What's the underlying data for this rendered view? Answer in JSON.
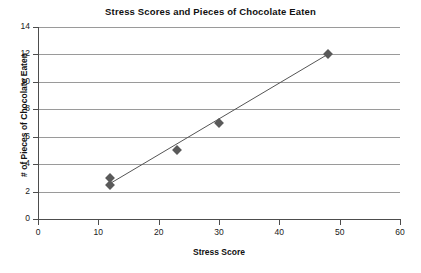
{
  "chart_data": {
    "type": "scatter",
    "title": "Stress Scores and Pieces of Chocolate Eaten",
    "xlabel": "Stress Score",
    "ylabel": "# of Pieces of Chocolate Eaten",
    "xlim": [
      0,
      60
    ],
    "ylim": [
      0,
      14
    ],
    "xticks": [
      0,
      10,
      20,
      30,
      40,
      50,
      60
    ],
    "yticks": [
      0,
      2,
      4,
      6,
      8,
      10,
      12,
      14
    ],
    "grid": "horizontal",
    "legend": "none",
    "marker": "diamond",
    "marker_color": "#5a5a5a",
    "trendline": {
      "visible": true,
      "color": "#555555",
      "x0": 12,
      "y0": 2.6,
      "x1": 48,
      "y1": 12.0
    },
    "points": [
      {
        "x": 12,
        "y": 3.0
      },
      {
        "x": 12,
        "y": 2.5
      },
      {
        "x": 23,
        "y": 5.0
      },
      {
        "x": 30,
        "y": 7.0
      },
      {
        "x": 48,
        "y": 12.0
      }
    ]
  }
}
